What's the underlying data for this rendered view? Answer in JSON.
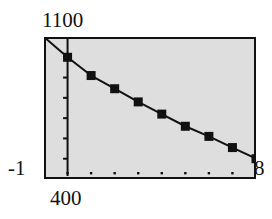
{
  "figure": {
    "background_color": "#ffffff",
    "plot_fill_color": "#dedede",
    "frame_color": "#111111",
    "ink_color": "#111111"
  },
  "labels": {
    "y_max": "1100",
    "y_min": "400",
    "x_min": "-1",
    "x_max": "8"
  },
  "chart_data": {
    "type": "line",
    "title": "",
    "xlabel": "",
    "ylabel": "",
    "xlim": [
      -1,
      8
    ],
    "ylim": [
      400,
      1100
    ],
    "grid": false,
    "legend": null,
    "frame": true,
    "plot_background": "#dedede",
    "marker": "filled-square",
    "marker_size_px": 9,
    "line_color": "#111111",
    "line_width_px": 2,
    "x_axis_line_at_y": 400,
    "y_axis_line_at_x": 0,
    "y_axis_tick_count": 8,
    "x_axis_tick_count": 10,
    "x_tick_values": [
      -1,
      0,
      1,
      2,
      3,
      4,
      5,
      6,
      7,
      8
    ],
    "y_tick_values": [
      400,
      500,
      600,
      700,
      800,
      900,
      1000,
      1100
    ],
    "series": [
      {
        "name": "curve",
        "x": [
          -1,
          0,
          1,
          2,
          3,
          4,
          5,
          6,
          7,
          8
        ],
        "y": [
          1100,
          1000,
          910,
          845,
          780,
          720,
          660,
          610,
          555,
          500
        ],
        "marker_x": [
          0,
          1,
          2,
          3,
          4,
          5,
          6,
          7,
          8
        ],
        "marker_y": [
          1000,
          910,
          845,
          780,
          720,
          660,
          610,
          555,
          500
        ]
      }
    ]
  }
}
